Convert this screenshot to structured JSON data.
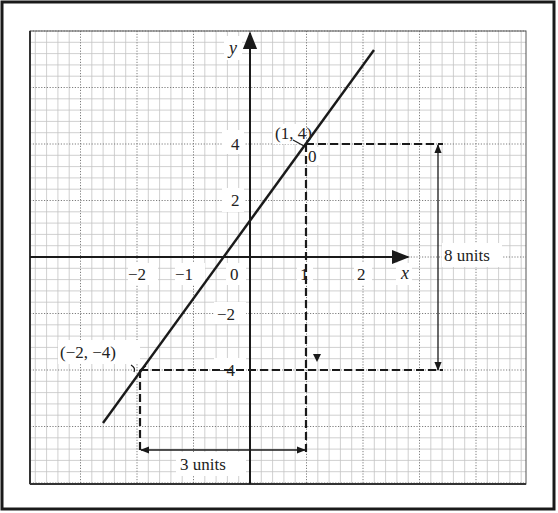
{
  "chart_data": {
    "type": "line",
    "title": "",
    "xlabel": "x",
    "ylabel": "y",
    "xlim": [
      -4,
      4.8
    ],
    "ylim": [
      -8,
      8
    ],
    "grid": true,
    "x_ticks": [
      {
        "value": -2,
        "label": "−2"
      },
      {
        "value": -1,
        "label": "−1"
      },
      {
        "value": 0,
        "label": "0"
      },
      {
        "value": 1,
        "label": "1"
      },
      {
        "value": 2,
        "label": "2"
      }
    ],
    "y_ticks": [
      {
        "value": 4,
        "label": "4"
      },
      {
        "value": 2,
        "label": "2"
      },
      {
        "value": -2,
        "label": "−2"
      },
      {
        "value": -4,
        "label": "−4"
      }
    ],
    "series": [
      {
        "name": "line y = (8/3)x + 4/3",
        "x": [
          -2.6,
          2.2
        ],
        "y": [
          -5.6,
          7.2
        ]
      }
    ],
    "points": [
      {
        "x": 1,
        "y": 4,
        "label": "(1, 4)"
      },
      {
        "x": -2,
        "y": -4,
        "label": "(−2, −4)"
      }
    ],
    "annotations": [
      {
        "type": "dimension",
        "orientation": "vertical",
        "label": "8 units",
        "from": 4,
        "to": -4
      },
      {
        "type": "dimension",
        "orientation": "horizontal",
        "label": "3 units",
        "from": -2,
        "to": 1
      },
      {
        "type": "marker",
        "label": "0",
        "near": "(1, 4)"
      }
    ]
  },
  "labels": {
    "x_axis": "x",
    "y_axis": "y",
    "point_a": "(1, 4)",
    "point_b": "(−2, −4)",
    "rise": "8 units",
    "run": "3 units",
    "marker_zero": "0",
    "x_tick_m2": "−2",
    "x_tick_m1": "−1",
    "origin": "0",
    "x_tick_1": "1",
    "x_tick_2": "2",
    "y_tick_4": "4",
    "y_tick_2": "2",
    "y_tick_m2": "−2",
    "y_tick_m4": "−4"
  },
  "colors": {
    "ink": "#1a1a1a",
    "grid_minor": "#bdbdbd",
    "grid_major": "#8a8a8a",
    "background": "#ffffff"
  }
}
